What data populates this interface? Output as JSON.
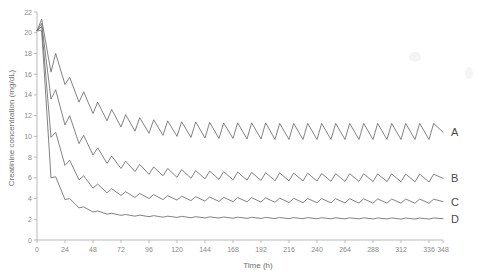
{
  "chart_data": {
    "type": "line",
    "title": "",
    "xlabel": "Time (h)",
    "ylabel": "Creatinine concentration (mg/dL)",
    "xlim": [
      0,
      348
    ],
    "ylim": [
      0,
      22
    ],
    "xticks": [
      0,
      24,
      48,
      72,
      96,
      120,
      144,
      168,
      192,
      216,
      240,
      264,
      288,
      312,
      336,
      348
    ],
    "xtick_labels": [
      "0",
      "24",
      "48",
      "72",
      "96",
      "120",
      "144",
      "168",
      "192",
      "216",
      "240",
      "264",
      "288",
      "312",
      "336",
      "348"
    ],
    "yticks": [
      0,
      2,
      4,
      6,
      8,
      10,
      12,
      14,
      16,
      18,
      20,
      22
    ],
    "ytick_labels": [
      "0",
      "2",
      "4",
      "6",
      "8",
      "10",
      "12",
      "14",
      "16",
      "18",
      "20",
      "22"
    ],
    "grid": false,
    "legend_position": "right-inline",
    "dose_interval_h": 12,
    "series": [
      {
        "name": "A",
        "label": "A",
        "color": "#6b6b6b",
        "peak_initial": 21.3,
        "trough_steady": 10.5,
        "peak_steady": 12.0,
        "x": [
          0,
          4,
          12,
          16,
          24,
          28,
          36,
          40,
          48,
          52,
          60,
          64,
          72,
          76,
          84,
          88,
          96,
          100,
          108,
          112,
          120,
          124,
          132,
          136,
          144,
          148,
          156,
          160,
          168,
          172,
          180,
          184,
          192,
          196,
          204,
          208,
          216,
          220,
          228,
          232,
          240,
          244,
          252,
          256,
          264,
          268,
          276,
          280,
          288,
          292,
          300,
          304,
          312,
          316,
          324,
          328,
          336,
          340,
          348
        ],
        "y": [
          20.2,
          21.3,
          16.2,
          18.0,
          15.0,
          15.7,
          13.3,
          14.3,
          12.2,
          13.3,
          11.5,
          12.6,
          10.9,
          12.1,
          10.5,
          11.8,
          10.3,
          11.6,
          10.1,
          11.5,
          10.0,
          11.4,
          9.9,
          11.4,
          9.85,
          11.35,
          9.8,
          11.3,
          9.8,
          11.3,
          9.75,
          11.3,
          9.75,
          11.3,
          9.7,
          11.25,
          9.7,
          11.25,
          9.7,
          11.25,
          9.7,
          11.25,
          9.7,
          11.25,
          9.7,
          11.25,
          9.7,
          11.25,
          9.7,
          11.25,
          9.7,
          11.25,
          9.7,
          11.25,
          9.7,
          11.25,
          9.7,
          11.25,
          10.4
        ]
      },
      {
        "name": "B",
        "label": "B",
        "color": "#6b6b6b",
        "peak_initial": 20.9,
        "trough_steady": 5.6,
        "peak_steady": 6.5,
        "x": [
          0,
          4,
          12,
          16,
          24,
          28,
          36,
          40,
          48,
          52,
          60,
          64,
          72,
          76,
          84,
          88,
          96,
          100,
          108,
          112,
          120,
          124,
          132,
          136,
          144,
          148,
          156,
          160,
          168,
          172,
          180,
          184,
          192,
          196,
          204,
          208,
          216,
          220,
          228,
          232,
          240,
          244,
          252,
          256,
          264,
          268,
          276,
          280,
          288,
          292,
          300,
          304,
          312,
          316,
          324,
          328,
          336,
          340,
          348
        ],
        "y": [
          20.2,
          20.9,
          13.6,
          14.5,
          11.1,
          12.0,
          9.3,
          10.1,
          8.2,
          8.9,
          7.4,
          8.1,
          6.9,
          7.6,
          6.6,
          7.3,
          6.35,
          7.05,
          6.2,
          6.9,
          6.05,
          6.8,
          5.95,
          6.7,
          5.9,
          6.65,
          5.85,
          6.6,
          5.8,
          6.55,
          5.78,
          6.52,
          5.75,
          6.5,
          5.72,
          6.48,
          5.7,
          6.45,
          5.7,
          6.45,
          5.68,
          6.42,
          5.66,
          6.4,
          5.65,
          6.4,
          5.65,
          6.4,
          5.64,
          6.38,
          5.63,
          6.38,
          5.62,
          6.36,
          5.62,
          6.36,
          5.6,
          6.35,
          5.95
        ]
      },
      {
        "name": "C",
        "label": "C",
        "color": "#6b6b6b",
        "peak_initial": 20.6,
        "trough_steady": 3.5,
        "peak_steady": 4.0,
        "x": [
          0,
          4,
          12,
          16,
          24,
          28,
          36,
          40,
          48,
          52,
          60,
          64,
          72,
          76,
          84,
          88,
          96,
          100,
          108,
          112,
          120,
          124,
          132,
          136,
          144,
          148,
          156,
          160,
          168,
          172,
          180,
          184,
          192,
          196,
          204,
          208,
          216,
          220,
          228,
          232,
          240,
          244,
          252,
          256,
          264,
          268,
          276,
          280,
          288,
          292,
          300,
          304,
          312,
          316,
          324,
          328,
          336,
          340,
          348
        ],
        "y": [
          20.2,
          20.6,
          9.9,
          10.4,
          7.2,
          7.7,
          5.8,
          6.2,
          5.0,
          5.4,
          4.55,
          4.95,
          4.3,
          4.65,
          4.1,
          4.5,
          4.0,
          4.38,
          3.9,
          4.28,
          3.85,
          4.22,
          3.8,
          4.18,
          3.75,
          4.15,
          3.72,
          4.12,
          3.7,
          4.1,
          3.68,
          4.08,
          3.66,
          4.06,
          3.64,
          4.04,
          3.62,
          4.02,
          3.6,
          4.0,
          3.6,
          4.0,
          3.58,
          3.98,
          3.58,
          3.98,
          3.57,
          3.97,
          3.56,
          3.96,
          3.56,
          3.96,
          3.55,
          3.95,
          3.55,
          3.95,
          3.54,
          3.94,
          3.7
        ]
      },
      {
        "name": "D",
        "label": "D",
        "color": "#6b6b6b",
        "peak_initial": 20.2,
        "trough_steady": 2.0,
        "peak_steady": 2.3,
        "x": [
          0,
          4,
          12,
          16,
          24,
          28,
          36,
          40,
          48,
          52,
          60,
          64,
          72,
          76,
          84,
          88,
          96,
          100,
          108,
          112,
          120,
          124,
          132,
          136,
          144,
          148,
          156,
          160,
          168,
          172,
          180,
          184,
          192,
          196,
          204,
          208,
          216,
          220,
          228,
          232,
          240,
          244,
          252,
          256,
          264,
          268,
          276,
          280,
          288,
          292,
          300,
          304,
          312,
          316,
          324,
          328,
          336,
          340,
          348
        ],
        "y": [
          20.2,
          20.2,
          6.0,
          6.1,
          3.9,
          4.0,
          3.1,
          3.2,
          2.7,
          2.8,
          2.5,
          2.58,
          2.38,
          2.46,
          2.3,
          2.4,
          2.25,
          2.35,
          2.2,
          2.3,
          2.18,
          2.28,
          2.15,
          2.25,
          2.13,
          2.23,
          2.12,
          2.22,
          2.1,
          2.2,
          2.09,
          2.19,
          2.08,
          2.18,
          2.07,
          2.17,
          2.06,
          2.16,
          2.06,
          2.16,
          2.05,
          2.15,
          2.05,
          2.15,
          2.04,
          2.14,
          2.04,
          2.14,
          2.03,
          2.13,
          2.03,
          2.13,
          2.02,
          2.12,
          2.02,
          2.12,
          2.02,
          2.12,
          2.06
        ]
      }
    ]
  },
  "axes": {
    "x_title": "Time (h)",
    "y_title": "Creatinine concentration (mg/dL)"
  }
}
